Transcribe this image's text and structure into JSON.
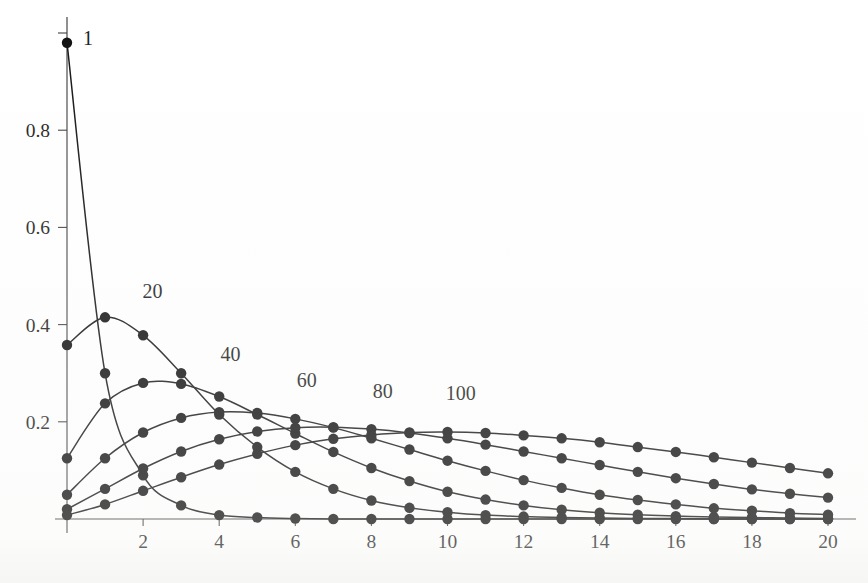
{
  "figure": {
    "background_color": "#ffffff",
    "ink_color": "#111111",
    "axis_color": "#3c3c3c"
  },
  "geometry": {
    "x_axis_px": {
      "x0": 67,
      "x20": 828,
      "baseline_y": 519
    },
    "y_axis_px": {
      "y0": 519,
      "y1": 33,
      "axis_x": 67
    },
    "marker_radius": 5.2
  },
  "chart_data": {
    "type": "line",
    "title": "",
    "subtitle": "",
    "xlabel": "",
    "ylabel": "",
    "xlim": [
      0,
      20
    ],
    "ylim": [
      0,
      1
    ],
    "grid": false,
    "legend": "inline-curve-labels",
    "legend_position": "above-curve-peak",
    "x_ticks": [
      0,
      2,
      4,
      6,
      8,
      10,
      12,
      14,
      16,
      18,
      20
    ],
    "x_tick_labels": [
      "",
      "2",
      "4",
      "6",
      "8",
      "10",
      "12",
      "14",
      "16",
      "18",
      "20"
    ],
    "y_ticks": [
      0,
      0.2,
      0.4,
      0.6,
      0.8,
      1
    ],
    "y_tick_labels": [
      "",
      "0.2",
      "0.4",
      "0.6",
      "0.8",
      ""
    ],
    "marker": "filled-circle",
    "x": [
      0,
      1,
      2,
      3,
      4,
      5,
      6,
      7,
      8,
      9,
      10,
      11,
      12,
      13,
      14,
      15,
      16,
      17,
      18,
      19,
      20
    ],
    "series": [
      {
        "name": "1",
        "label": "1",
        "label_x": 0.55,
        "label_y": 0.975,
        "values": [
          0.98,
          0.3,
          0.09,
          0.028,
          0.008,
          0.003,
          0.001,
          0.0,
          0.0,
          0.0,
          0.0,
          0.0,
          0.0,
          0.0,
          0.0,
          0.0,
          0.0,
          0.0,
          0.0,
          0.0,
          0.0
        ]
      },
      {
        "name": "20",
        "label": "20",
        "label_x": 2.25,
        "label_y": 0.455,
        "values": [
          0.358,
          0.415,
          0.378,
          0.3,
          0.215,
          0.148,
          0.097,
          0.062,
          0.038,
          0.023,
          0.014,
          0.008,
          0.005,
          0.003,
          0.002,
          0.001,
          0.001,
          0.0,
          0.0,
          0.0,
          0.0
        ]
      },
      {
        "name": "40",
        "label": "40",
        "label_x": 4.3,
        "label_y": 0.325,
        "values": [
          0.125,
          0.238,
          0.28,
          0.278,
          0.252,
          0.215,
          0.176,
          0.138,
          0.105,
          0.078,
          0.056,
          0.04,
          0.028,
          0.019,
          0.013,
          0.009,
          0.006,
          0.004,
          0.003,
          0.002,
          0.001
        ]
      },
      {
        "name": "60",
        "label": "60",
        "label_x": 6.3,
        "label_y": 0.272,
        "values": [
          0.05,
          0.125,
          0.178,
          0.208,
          0.22,
          0.218,
          0.206,
          0.188,
          0.166,
          0.143,
          0.12,
          0.099,
          0.08,
          0.064,
          0.05,
          0.039,
          0.03,
          0.022,
          0.017,
          0.012,
          0.009
        ]
      },
      {
        "name": "80",
        "label": "80",
        "label_x": 8.3,
        "label_y": 0.248,
        "values": [
          0.02,
          0.062,
          0.104,
          0.139,
          0.164,
          0.18,
          0.188,
          0.189,
          0.185,
          0.177,
          0.166,
          0.153,
          0.139,
          0.125,
          0.111,
          0.097,
          0.084,
          0.072,
          0.061,
          0.052,
          0.044
        ]
      },
      {
        "name": "100",
        "label": "100",
        "label_x": 10.35,
        "label_y": 0.245,
        "values": [
          0.008,
          0.03,
          0.058,
          0.086,
          0.112,
          0.134,
          0.152,
          0.165,
          0.173,
          0.178,
          0.179,
          0.177,
          0.172,
          0.166,
          0.158,
          0.148,
          0.138,
          0.127,
          0.116,
          0.105,
          0.094
        ]
      }
    ]
  }
}
